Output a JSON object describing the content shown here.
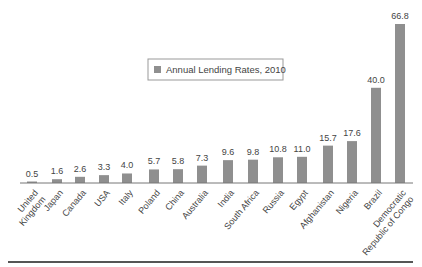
{
  "chart_data": {
    "type": "bar",
    "title": "",
    "xlabel": "",
    "ylabel": "",
    "ylim": [
      0,
      70
    ],
    "grid": false,
    "legend_position": "upper-center",
    "legend": [
      "Annual Lending Rates, 2010"
    ],
    "categories": [
      "United Kingdom",
      "Japan",
      "Canada",
      "USA",
      "Italy",
      "Poland",
      "China",
      "Australia",
      "India",
      "South Africa",
      "Russia",
      "Egypt",
      "Afghanistan",
      "Nigeria",
      "Brazil",
      "Democratic Republic of Congo"
    ],
    "category_lines": [
      [
        "United",
        "Kingdom"
      ],
      [
        "Japan"
      ],
      [
        "Canada"
      ],
      [
        "USA"
      ],
      [
        "Italy"
      ],
      [
        "Poland"
      ],
      [
        "China"
      ],
      [
        "Australia"
      ],
      [
        "India"
      ],
      [
        "South Africa"
      ],
      [
        "Russia"
      ],
      [
        "Egypt"
      ],
      [
        "Afghanistan"
      ],
      [
        "Nigeria"
      ],
      [
        "Brazil"
      ],
      [
        "Democratic",
        "Republic of Congo"
      ]
    ],
    "series": [
      {
        "name": "Annual Lending Rates, 2010",
        "values": [
          0.5,
          1.6,
          2.6,
          3.3,
          4.0,
          5.7,
          5.8,
          7.3,
          9.6,
          9.8,
          10.8,
          11.0,
          15.7,
          17.6,
          40.0,
          66.8
        ],
        "labels": [
          "0.5",
          "1.6",
          "2.6",
          "3.3",
          "4.0",
          "5.7",
          "5.8",
          "7.3",
          "9.6",
          "9.8",
          "10.8",
          "11.0",
          "15.7",
          "17.6",
          "40.0",
          "66.8"
        ]
      }
    ],
    "colors": {
      "bar": "#8f8f8f",
      "axis": "#777777",
      "text": "#444444"
    }
  },
  "legend": {
    "label": "Annual Lending Rates, 2010"
  }
}
